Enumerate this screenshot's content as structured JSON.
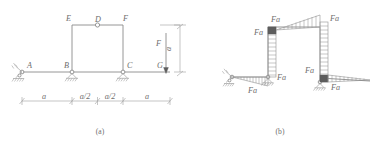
{
  "figure": {
    "caption_a": "(a)",
    "caption_b": "(b)",
    "units_note": ""
  },
  "diagram_a": {
    "title": "Frame with pin supports and hinge",
    "joint_labels": {
      "A": "A",
      "B": "B",
      "C": "C",
      "D": "D",
      "E": "E",
      "F": "F",
      "G": "G"
    },
    "load_label": "F",
    "height_dim_label": "a",
    "dimensions": [
      {
        "label": "a"
      },
      {
        "label": "a/2"
      },
      {
        "label": "a/2"
      },
      {
        "label": "a"
      }
    ],
    "supports": [
      {
        "at": "A",
        "type": "pin-support"
      },
      {
        "at": "B",
        "type": "pin-support"
      },
      {
        "at": "C",
        "type": "pin-support"
      }
    ],
    "hinge": {
      "at": "D",
      "type": "internal-hinge"
    }
  },
  "diagram_b": {
    "title": "Bending moment diagram",
    "moment_labels": [
      {
        "id": "m1",
        "text": "Fa"
      },
      {
        "id": "m2",
        "text": "Fa"
      },
      {
        "id": "m3",
        "text": "Fa"
      },
      {
        "id": "m4",
        "text": "Fa"
      },
      {
        "id": "m5",
        "text": "Fa"
      },
      {
        "id": "m6",
        "text": "Fa"
      },
      {
        "id": "m7",
        "text": "Fa"
      }
    ]
  },
  "colors": {
    "line": "#8a8a8a",
    "text": "#6e6e6e",
    "fill_solid": "#5d5d5d",
    "background": "#ffffff"
  }
}
